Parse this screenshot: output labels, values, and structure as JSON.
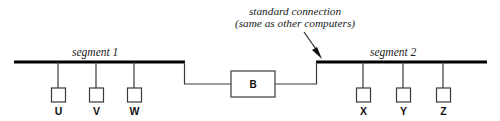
{
  "diagram": {
    "annotation": {
      "line1": "standard connection",
      "line2": "(same as other computers)"
    },
    "segments": [
      {
        "id": "segment-1",
        "label": "segment 1",
        "nodes": [
          {
            "label": "U"
          },
          {
            "label": "V"
          },
          {
            "label": "W"
          }
        ]
      },
      {
        "id": "segment-2",
        "label": "segment 2",
        "nodes": [
          {
            "label": "X"
          },
          {
            "label": "Y"
          },
          {
            "label": "Z"
          }
        ]
      }
    ],
    "bridge": {
      "label": "B"
    },
    "colors": {
      "bus": "#000000",
      "wire": "#3a3a3a",
      "box_fill": "#ffffff",
      "text": "#1a1a1a",
      "background": "#ffffff"
    }
  }
}
